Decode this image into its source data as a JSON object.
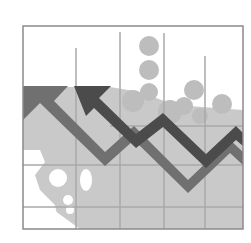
{
  "illustration": {
    "title": "Declining chart clipart",
    "description": "Grayscale illustration of a framed chart with bar grid, circles, and two zigzag arrows pointing up-left",
    "colors": {
      "background": "#ffffff",
      "frame": "#8a8a8a",
      "grid": "#a8a8a8",
      "light_fill": "#c8c8c8",
      "circles": "#bdbdbd",
      "arrow_mid": "#6e6e6e",
      "arrow_dark": "#4a4a4a"
    }
  }
}
